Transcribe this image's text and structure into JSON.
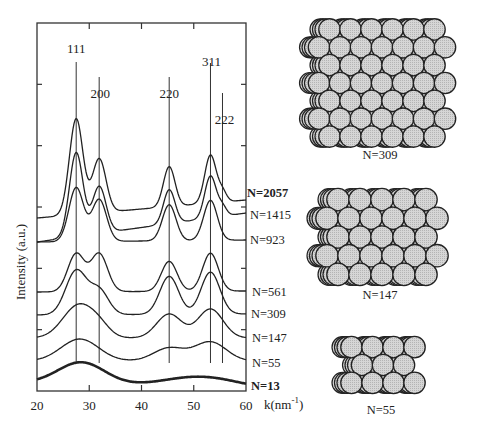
{
  "chart_data": {
    "type": "line",
    "title": "",
    "xlabel": "k(nm^-1)",
    "xlabel_main": "k(nm",
    "xlabel_sup": "-1",
    "xlabel_close": ")",
    "ylabel": "Intensity (a.u.)",
    "xlim": [
      20,
      60
    ],
    "xticks": [
      20,
      30,
      40,
      50,
      60
    ],
    "yticks_count": 5,
    "grid": false,
    "legend_position": "right-of-curves (inline labels)",
    "peak_markers": [
      {
        "label": "111",
        "k": 27.5
      },
      {
        "label": "200",
        "k": 31.9
      },
      {
        "label": "220",
        "k": 45.3
      },
      {
        "label": "311",
        "k": 53.2
      },
      {
        "label": "222",
        "k": 55.5
      }
    ],
    "series": [
      {
        "name": "N=2057",
        "bold_label": true,
        "offset_px": 218,
        "end_px": 200,
        "peaks": [
          {
            "k": 27.5,
            "h": 96,
            "w": 1.3
          },
          {
            "k": 31.9,
            "h": 54,
            "w": 1.3
          },
          {
            "k": 45.3,
            "h": 40,
            "w": 1.1
          },
          {
            "k": 53.2,
            "h": 48,
            "w": 1.1
          },
          {
            "k": 55.5,
            "h": 10,
            "w": 0.8
          }
        ]
      },
      {
        "name": "N=1415",
        "bold_label": false,
        "offset_px": 242,
        "end_px": 213,
        "peaks": [
          {
            "k": 27.5,
            "h": 84,
            "w": 1.3
          },
          {
            "k": 31.9,
            "h": 47,
            "w": 1.3
          },
          {
            "k": 45.3,
            "h": 34,
            "w": 1.1
          },
          {
            "k": 53.2,
            "h": 42,
            "w": 1.1
          },
          {
            "k": 55.5,
            "h": 9,
            "w": 0.8
          }
        ]
      },
      {
        "name": "N=923",
        "bold_label": false,
        "offset_px": 242,
        "end_px": 240,
        "peaks": [
          {
            "k": 27.5,
            "h": 54,
            "w": 1.4
          },
          {
            "k": 31.9,
            "h": 42,
            "w": 1.4
          },
          {
            "k": 45.3,
            "h": 36,
            "w": 1.3
          },
          {
            "k": 53.2,
            "h": 40,
            "w": 1.3
          }
        ]
      },
      {
        "name": "N=561",
        "bold_label": false,
        "offset_px": 292,
        "end_px": 291,
        "peaks": [
          {
            "k": 27.5,
            "h": 38,
            "w": 1.6
          },
          {
            "k": 31.9,
            "h": 38,
            "w": 1.6
          },
          {
            "k": 45.3,
            "h": 30,
            "w": 1.5
          },
          {
            "k": 53.2,
            "h": 38,
            "w": 1.5
          }
        ]
      },
      {
        "name": "N=309",
        "bold_label": false,
        "offset_px": 315,
        "end_px": 314,
        "peaks": [
          {
            "k": 27.5,
            "h": 44,
            "w": 2.0
          },
          {
            "k": 31.9,
            "h": 24,
            "w": 1.8
          },
          {
            "k": 45.3,
            "h": 38,
            "w": 1.8
          },
          {
            "k": 53.2,
            "h": 42,
            "w": 1.8
          }
        ]
      },
      {
        "name": "N=147",
        "bold_label": false,
        "offset_px": 338,
        "end_px": 338,
        "peaks": [
          {
            "k": 28.0,
            "h": 33,
            "w": 3.0
          },
          {
            "k": 32.0,
            "h": 8,
            "w": 2.0
          },
          {
            "k": 45.3,
            "h": 24,
            "w": 2.4
          },
          {
            "k": 53.2,
            "h": 29,
            "w": 2.4
          }
        ]
      },
      {
        "name": "N=55",
        "bold_label": false,
        "offset_px": 361,
        "end_px": 361,
        "peaks": [
          {
            "k": 28.2,
            "h": 22,
            "w": 3.6
          },
          {
            "k": 45.3,
            "h": 13,
            "w": 3.0
          },
          {
            "k": 53.2,
            "h": 19,
            "w": 3.0
          }
        ]
      },
      {
        "name": "N=13",
        "bold_label": true,
        "offset_px": 383,
        "end_px": 389,
        "peaks": [
          {
            "k": 28.5,
            "h": 22,
            "w": 4.5
          },
          {
            "k": 51.5,
            "h": 11,
            "w": 7.0
          }
        ]
      }
    ]
  },
  "clusters": [
    {
      "label": "N=309",
      "cx": 380,
      "cy": 83,
      "rx": 82,
      "ry": 62,
      "r": 10.5
    },
    {
      "label": "N=147",
      "cx": 380,
      "cy": 237,
      "rx": 70,
      "ry": 48,
      "r": 11
    },
    {
      "label": "N=55",
      "cx": 381,
      "cy": 365,
      "rx": 46,
      "ry": 35,
      "r": 10.5
    }
  ]
}
